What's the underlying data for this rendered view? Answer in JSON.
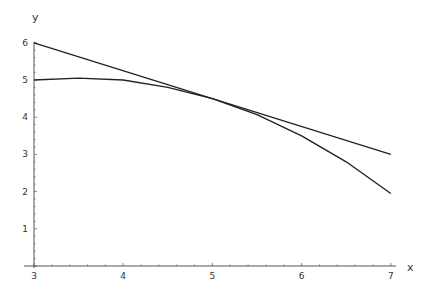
{
  "chart_data": {
    "type": "line",
    "title": "",
    "xlabel": "x",
    "ylabel": "y",
    "xlim": [
      3,
      7
    ],
    "ylim": [
      0,
      6
    ],
    "grid": false,
    "legend": null,
    "x_ticks": [
      3,
      4,
      5,
      6,
      7
    ],
    "y_ticks": [
      1,
      2,
      3,
      4,
      5,
      6
    ],
    "series": [
      {
        "name": "curve",
        "x": [
          3,
          3.5,
          4,
          4.5,
          5,
          5.5,
          6,
          6.5,
          7
        ],
        "y": [
          5.0,
          5.05,
          5.0,
          4.8,
          4.5,
          4.07,
          3.5,
          2.8,
          1.95
        ]
      },
      {
        "name": "tangent line at x=5",
        "x": [
          3,
          7
        ],
        "y": [
          6.0,
          3.0
        ]
      }
    ],
    "annotations": []
  },
  "style": {
    "line_color": "#222222",
    "axis_color": "#555555",
    "background": "#ffffff"
  },
  "axes": {
    "x_label": "x",
    "y_label": "y"
  }
}
